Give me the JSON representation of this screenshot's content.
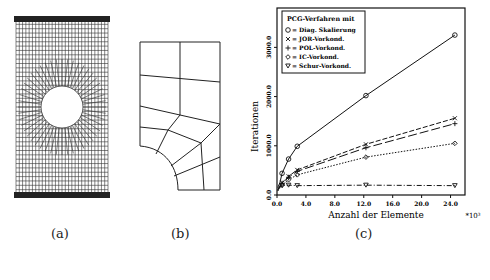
{
  "captions": {
    "a": "(a)",
    "b": "(b)",
    "c": "(c)"
  },
  "panel_a": {
    "description": "Fine FE mesh of plate with circular hole, clamped top and bottom edges"
  },
  "panel_b": {
    "description": "Coarse quarter-plate mesh with quarter-circle hole"
  },
  "chart_data": {
    "type": "line",
    "title": "",
    "legend_title": "PCG-Verfahren mit",
    "xlabel": "Anzahl der Elemente",
    "x_multiplier": "*10³",
    "ylabel": "Iterationen",
    "xlim": [
      0,
      26
    ],
    "ylim": [
      0,
      3800
    ],
    "x_ticks": [
      "0.0",
      "4.0",
      "8.0",
      "12.0",
      "16.0",
      "20.0",
      "24.0"
    ],
    "y_ticks": [
      "0.0",
      "1000.0",
      "2000.0",
      "3000.0"
    ],
    "legend_position": "upper-left",
    "grid": false,
    "series": [
      {
        "name": "Diag. Skalierung",
        "marker": "o",
        "line": "solid",
        "x": [
          0.1,
          0.4,
          0.7,
          1.6,
          2.8,
          12.3,
          24.6
        ],
        "y": [
          150,
          250,
          440,
          730,
          990,
          2020,
          3250
        ]
      },
      {
        "name": "JOR-Vorkond.",
        "marker": "x",
        "line": "dashed",
        "x": [
          0.1,
          0.4,
          0.7,
          1.6,
          2.8,
          12.3,
          24.6
        ],
        "y": [
          100,
          180,
          250,
          380,
          510,
          1030,
          1560
        ]
      },
      {
        "name": "POL-Vorkond.",
        "marker": "+",
        "line": "long-dashed",
        "x": [
          0.1,
          0.4,
          0.7,
          1.6,
          2.8,
          12.3,
          24.6
        ],
        "y": [
          95,
          170,
          240,
          360,
          480,
          960,
          1450
        ]
      },
      {
        "name": "IC-Vorkond.",
        "marker": "diamond",
        "line": "dotted",
        "x": [
          0.1,
          0.4,
          0.7,
          1.6,
          2.8,
          12.3,
          24.6
        ],
        "y": [
          80,
          140,
          200,
          310,
          410,
          770,
          1050
        ]
      },
      {
        "name": "Schur-Vorkond.",
        "marker": "triangle-down",
        "line": "dash-dot",
        "x": [
          0.1,
          0.4,
          0.7,
          1.6,
          2.8,
          12.3,
          24.6
        ],
        "y": [
          130,
          170,
          190,
          200,
          190,
          200,
          190
        ]
      }
    ]
  }
}
